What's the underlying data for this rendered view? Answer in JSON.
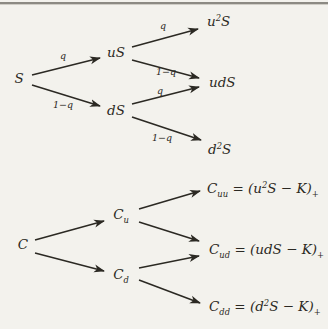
{
  "figure": {
    "colors": {
      "background": "#f3f2ed",
      "ink": "#2b2923",
      "top_rule": "#8c8a83"
    },
    "stock_tree": {
      "nodes": {
        "root": "S",
        "up": "uS",
        "down": "dS",
        "up_up": "u^{2}S",
        "up_down": "udS",
        "down_down": "d^{2}S"
      },
      "edge_labels": {
        "up": "q",
        "down": "1−q"
      }
    },
    "option_tree": {
      "nodes": {
        "root": "C",
        "up": "C_{u}",
        "down": "C_{d}",
        "up_up": "C_{uu} = (u^{2}S − K)_{+}",
        "up_down": "C_{ud} = (udS − K)_{+}",
        "down_down": "C_{dd} = (d^{2}S − K)_{+}"
      }
    }
  }
}
